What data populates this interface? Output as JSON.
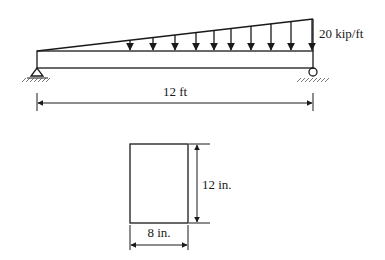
{
  "beam": {
    "load_label": "20 kip/ft",
    "span_label": "12 ft",
    "load_type": "linearly varying distributed load (0 at left to max at right)",
    "supports": {
      "left": "pin",
      "right": "roller"
    },
    "arrow_x": [
      130,
      153,
      175,
      196,
      214,
      231,
      251,
      271,
      291,
      312
    ]
  },
  "cross_section": {
    "height_label": "12 in.",
    "width_label": "8 in.",
    "shape": "rectangle"
  },
  "colors": {
    "ink": "#1a1a1a",
    "background": "#ffffff"
  }
}
